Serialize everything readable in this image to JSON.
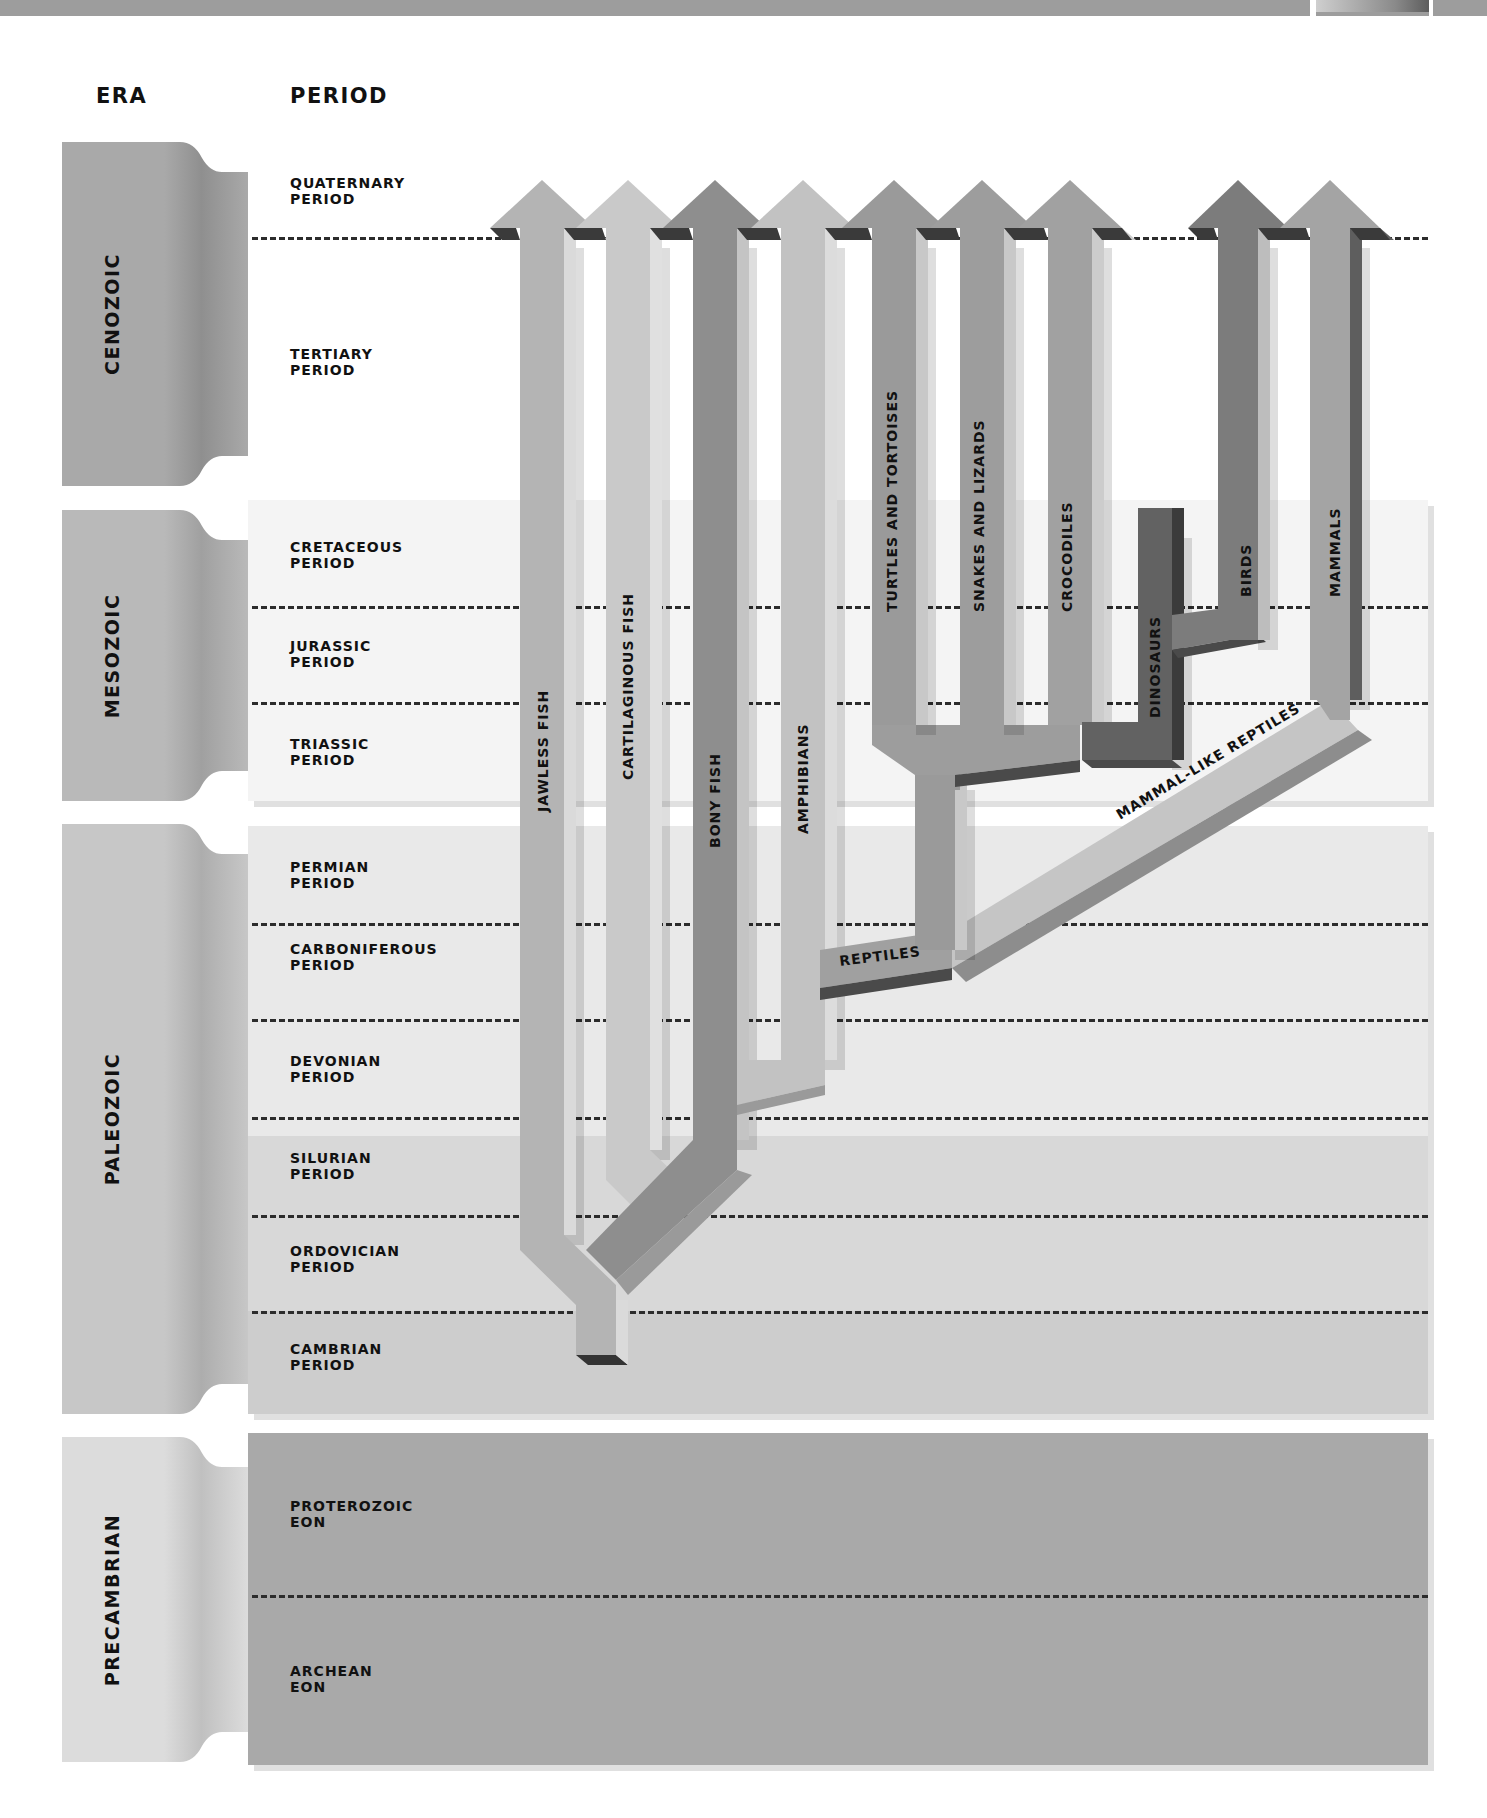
{
  "headers": {
    "era": "ERA",
    "period": "PERIOD"
  },
  "eras": [
    {
      "name": "CENOZOIC",
      "top": 142,
      "height": 344,
      "color": "#a9a9a9",
      "shade": "#8f8f8f"
    },
    {
      "name": "MESOZOIC",
      "top": 510,
      "height": 291,
      "color": "#b9b9b9",
      "shade": "#a0a0a0"
    },
    {
      "name": "PALEOZOIC",
      "top": 824,
      "height": 590,
      "color": "#c7c7c7",
      "shade": "#adadad"
    },
    {
      "name": "PRECAMBRIAN",
      "top": 1437,
      "height": 325,
      "color": "#dcdcdc",
      "shade": "#c0c0c0"
    }
  ],
  "periods": [
    {
      "name": "QUATERNARY PERIOD",
      "label_y": 183
    },
    {
      "name": "TERTIARY PERIOD",
      "label_y": 354
    },
    {
      "name": "CRETACEOUS PERIOD",
      "label_y": 547
    },
    {
      "name": "JURASSIC PERIOD",
      "label_y": 646
    },
    {
      "name": "TRIASSIC PERIOD",
      "label_y": 744
    },
    {
      "name": "PERMIAN PERIOD",
      "label_y": 867
    },
    {
      "name": "CARBONIFEROUS PERIOD",
      "label_y": 957
    },
    {
      "name": "DEVONIAN PERIOD",
      "label_y": 1061
    },
    {
      "name": "SILURIAN PERIOD",
      "label_y": 1158
    },
    {
      "name": "ORDOVICIAN PERIOD",
      "label_y": 1251
    },
    {
      "name": "CAMBRIAN PERIOD",
      "label_y": 1349
    },
    {
      "name": "PROTEROZOIC EON",
      "label_y": 1506
    },
    {
      "name": "ARCHEAN EON",
      "label_y": 1671
    }
  ],
  "carboniferous_label_lines": [
    "CARBONIFEROUS",
    "PERIOD"
  ],
  "period_bands": [
    {
      "top": 140,
      "height": 346,
      "color": "#ffffff"
    },
    {
      "top": 500,
      "height": 301,
      "color": "#f4f4f4"
    },
    {
      "top": 826,
      "height": 310,
      "color": "#e9e9e9"
    },
    {
      "top": 1136,
      "height": 175,
      "color": "#d8d8d8"
    },
    {
      "top": 1311,
      "height": 103,
      "color": "#cdcdcd"
    },
    {
      "top": 1433,
      "height": 332,
      "color": "#a9a9a9"
    }
  ],
  "dashed_boundaries_y": [
    237,
    606,
    702,
    923,
    1019,
    1117,
    1215,
    1311,
    1595
  ],
  "lineages": [
    {
      "name": "JAWLESS FISH",
      "color": "#b4b4b4",
      "side": "#dadada",
      "label_x": 548,
      "label_y": 812
    },
    {
      "name": "CARTILAGINOUS FISH",
      "color": "#c9c9c9",
      "side": "#e0e0e0",
      "label_x": 633,
      "label_y": 780
    },
    {
      "name": "BONY FISH",
      "color": "#8e8e8e",
      "side": "#c4c4c4",
      "label_x": 720,
      "label_y": 848
    },
    {
      "name": "AMPHIBIANS",
      "color": "#c2c2c2",
      "side": "#dcdcdc",
      "label_x": 808,
      "label_y": 834
    },
    {
      "name": "TURTLES AND TORTOISES",
      "color": "#9a9a9a",
      "side": "#c8c8c8",
      "label_x": 897,
      "label_y": 612
    },
    {
      "name": "SNAKES AND LIZARDS",
      "color": "#9d9d9d",
      "side": "#c8c8c8",
      "label_x": 984,
      "label_y": 612
    },
    {
      "name": "CROCODILES",
      "color": "#a1a1a1",
      "side": "#cccccc",
      "label_x": 1072,
      "label_y": 612
    },
    {
      "name": "DINOSAURS",
      "color": "#626262",
      "side": "#3b3b3b",
      "label_x": 1160,
      "label_y": 718
    },
    {
      "name": "BIRDS",
      "color": "#7c7c7c",
      "side": "#bdbdbd",
      "label_x": 1251,
      "label_y": 597
    },
    {
      "name": "MAMMALS",
      "color": "#a4a4a4",
      "side": "#5e5e5e",
      "label_x": 1340,
      "label_y": 597
    },
    {
      "name": "REPTILES",
      "color": "#a0a0a0",
      "side": "#5a5a5a",
      "label_x": 840,
      "label_y": 966
    },
    {
      "name": "MAMMAL-LIKE REPTILES",
      "color": "#c5c5c5",
      "side": "#8d8d8d",
      "label_x": 1120,
      "label_y": 820
    }
  ],
  "chart_data": {
    "type": "table",
    "columns": [
      "ERA",
      "PERIOD"
    ],
    "eras": {
      "CENOZOIC": [
        "QUATERNARY PERIOD",
        "TERTIARY PERIOD"
      ],
      "MESOZOIC": [
        "CRETACEOUS PERIOD",
        "JURASSIC PERIOD",
        "TRIASSIC PERIOD"
      ],
      "PALEOZOIC": [
        "PERMIAN PERIOD",
        "CARBONIFEROUS PERIOD",
        "DEVONIAN PERIOD",
        "SILURIAN PERIOD",
        "ORDOVICIAN PERIOD",
        "CAMBRIAN PERIOD"
      ],
      "PRECAMBRIAN": [
        "PROTEROZOIC EON",
        "ARCHEAN EON"
      ]
    },
    "lineages": [
      {
        "name": "JAWLESS FISH",
        "origin": "CAMBRIAN PERIOD",
        "extant": true
      },
      {
        "name": "CARTILAGINOUS FISH",
        "origin": "ORDOVICIAN PERIOD",
        "branch_from": "JAWLESS FISH",
        "extant": true
      },
      {
        "name": "BONY FISH",
        "origin": "ORDOVICIAN PERIOD",
        "branch_from": "JAWLESS FISH",
        "extant": true
      },
      {
        "name": "AMPHIBIANS",
        "origin": "DEVONIAN PERIOD",
        "branch_from": "BONY FISH",
        "extant": true
      },
      {
        "name": "REPTILES",
        "origin": "CARBONIFEROUS PERIOD",
        "branch_from": "AMPHIBIANS",
        "extant": false
      },
      {
        "name": "MAMMAL-LIKE REPTILES",
        "origin": "CARBONIFEROUS PERIOD",
        "branch_from": "REPTILES",
        "extant": false
      },
      {
        "name": "TURTLES AND TORTOISES",
        "origin": "TRIASSIC PERIOD",
        "branch_from": "REPTILES",
        "extant": true
      },
      {
        "name": "SNAKES AND LIZARDS",
        "origin": "TRIASSIC PERIOD",
        "branch_from": "REPTILES",
        "extant": true
      },
      {
        "name": "CROCODILES",
        "origin": "TRIASSIC PERIOD",
        "branch_from": "REPTILES",
        "extant": true
      },
      {
        "name": "DINOSAURS",
        "origin": "TRIASSIC PERIOD",
        "end": "CRETACEOUS PERIOD",
        "branch_from": "REPTILES",
        "extant": false
      },
      {
        "name": "BIRDS",
        "origin": "JURASSIC PERIOD",
        "branch_from": "DINOSAURS",
        "extant": true
      },
      {
        "name": "MAMMALS",
        "origin": "TRIASSIC PERIOD",
        "branch_from": "MAMMAL-LIKE REPTILES",
        "extant": true
      }
    ]
  }
}
